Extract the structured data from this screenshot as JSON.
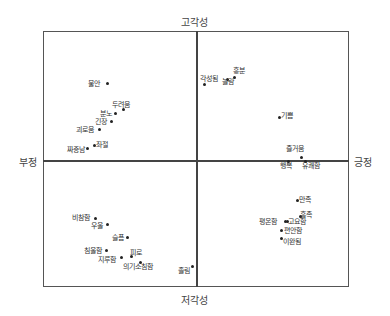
{
  "chart_data": {
    "type": "scatter",
    "title": "",
    "axes": {
      "top": "고각성",
      "bottom": "저각성",
      "left": "부정",
      "right": "긍정"
    },
    "xlim": [
      -1,
      1
    ],
    "ylim": [
      -1,
      1
    ],
    "grid": false,
    "points": [
      {
        "label": "불안",
        "x": -0.4,
        "y": 0.6,
        "lx": 88,
        "ly": 80,
        "px": 107,
        "py": 83
      },
      {
        "label": "두려움",
        "x": -0.46,
        "y": 0.41,
        "lx": 112,
        "ly": 101,
        "px": 123,
        "py": 109
      },
      {
        "label": "분노",
        "x": -0.52,
        "y": 0.35,
        "lx": 100,
        "ly": 110,
        "px": 115,
        "py": 113
      },
      {
        "label": "긴장",
        "x": -0.55,
        "y": 0.28,
        "lx": 95,
        "ly": 118,
        "px": 111,
        "py": 121
      },
      {
        "label": "괴로움",
        "x": -0.63,
        "y": 0.24,
        "lx": 76,
        "ly": 126,
        "px": 99,
        "py": 129
      },
      {
        "label": "좌절",
        "x": -0.66,
        "y": 0.11,
        "lx": 96,
        "ly": 141,
        "px": 94,
        "py": 145
      },
      {
        "label": "짜증남",
        "x": -0.73,
        "y": 0.09,
        "lx": 67,
        "ly": 146,
        "px": 87,
        "py": 148
      },
      {
        "label": "각성됨",
        "x": 0.07,
        "y": 0.6,
        "lx": 200,
        "ly": 75,
        "px": 204,
        "py": 84
      },
      {
        "label": "흥분",
        "x": 0.24,
        "y": 0.64,
        "lx": 233,
        "ly": 67,
        "px": 234,
        "py": 77
      },
      {
        "label": "놀람",
        "x": 0.2,
        "y": 0.62,
        "lx": 222,
        "ly": 78,
        "px": 227,
        "py": 79
      },
      {
        "label": "기쁨",
        "x": 0.54,
        "y": 0.33,
        "lx": 281,
        "ly": 112,
        "px": 279,
        "py": 117
      },
      {
        "label": "즐거움",
        "x": 0.7,
        "y": 0.02,
        "lx": 286,
        "ly": 145,
        "px": 301,
        "py": 157
      },
      {
        "label": "행복",
        "x": 0.6,
        "y": -0.01,
        "lx": 280,
        "ly": 162,
        "px": 288,
        "py": 161
      },
      {
        "label": "유쾌함",
        "x": 0.69,
        "y": -0.01,
        "lx": 302,
        "ly": 162,
        "px": 305,
        "py": 161
      },
      {
        "label": "만족",
        "x": 0.67,
        "y": -0.28,
        "lx": 299,
        "ly": 196,
        "px": 297,
        "py": 200
      },
      {
        "label": "흡족",
        "x": 0.71,
        "y": -0.41,
        "lx": 300,
        "ly": 211,
        "px": 300,
        "py": 216
      },
      {
        "label": "평온함",
        "x": 0.58,
        "y": -0.48,
        "lx": 259,
        "ly": 218,
        "px": 285,
        "py": 221
      },
      {
        "label": "고요함",
        "x": 0.59,
        "y": -0.48,
        "lx": 288,
        "ly": 218,
        "px": 287,
        "py": 221
      },
      {
        "label": "편안함",
        "x": 0.55,
        "y": -0.55,
        "lx": 284,
        "ly": 227,
        "px": 281,
        "py": 230
      },
      {
        "label": "이완됨",
        "x": 0.55,
        "y": -0.62,
        "lx": 283,
        "ly": 238,
        "px": 281,
        "py": 238
      },
      {
        "label": "비참함",
        "x": -0.81,
        "y": -0.43,
        "lx": 72,
        "ly": 214,
        "px": 95,
        "py": 218
      },
      {
        "label": "우울",
        "x": -0.74,
        "y": -0.48,
        "lx": 91,
        "ly": 222,
        "px": 107,
        "py": 224
      },
      {
        "label": "슬픔",
        "x": -0.61,
        "y": -0.58,
        "lx": 112,
        "ly": 234,
        "px": 127,
        "py": 237
      },
      {
        "label": "침울함",
        "x": -0.74,
        "y": -0.69,
        "lx": 84,
        "ly": 247,
        "px": 106,
        "py": 250
      },
      {
        "label": "피로",
        "x": -0.58,
        "y": -0.76,
        "lx": 130,
        "ly": 249,
        "px": 131,
        "py": 256
      },
      {
        "label": "지루함",
        "x": -0.6,
        "y": -0.77,
        "lx": 98,
        "ly": 256,
        "px": 121,
        "py": 257
      },
      {
        "label": "의기소침함",
        "x": -0.48,
        "y": -0.82,
        "lx": 123,
        "ly": 263,
        "px": 140,
        "py": 262
      },
      {
        "label": "졸림",
        "x": -0.02,
        "y": -0.84,
        "lx": 178,
        "ly": 267,
        "px": 192,
        "py": 266
      }
    ]
  }
}
